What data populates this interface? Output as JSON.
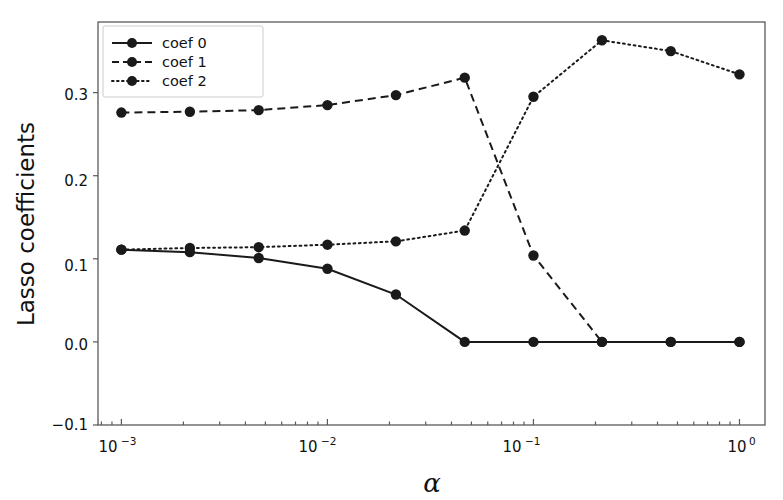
{
  "chart_data": {
    "type": "line",
    "title": "",
    "xlabel": "α",
    "ylabel": "Lasso coefficients",
    "xscale": "log",
    "yscale": "linear",
    "xlim": [
      0.00077,
      1.33
    ],
    "ylim": [
      -0.1,
      0.385
    ],
    "grid": false,
    "legend_position": "upper left",
    "x": [
      0.001,
      0.00215,
      0.00464,
      0.01,
      0.0215,
      0.0464,
      0.1,
      0.215,
      0.464,
      1.0
    ],
    "xtick_labels": [
      "10−3",
      "10−2",
      "10−1",
      "10⁰"
    ],
    "xtick_values": [
      0.001,
      0.01,
      0.1,
      1.0
    ],
    "ytick_labels": [
      "−0.1",
      "0.0",
      "0.1",
      "0.2",
      "0.3"
    ],
    "ytick_values": [
      -0.1,
      0.0,
      0.1,
      0.2,
      0.3
    ],
    "series": [
      {
        "name": "coef 0",
        "linestyle": "solid",
        "color": "#1a1a1a",
        "marker": "o",
        "values": [
          0.111,
          0.108,
          0.101,
          0.088,
          0.057,
          0.0,
          0.0,
          0.0,
          0.0,
          0.0
        ]
      },
      {
        "name": "coef 1",
        "linestyle": "dashed",
        "color": "#1a1a1a",
        "marker": "o",
        "values": [
          0.276,
          0.277,
          0.279,
          0.285,
          0.297,
          0.318,
          0.104,
          0.0,
          0.0,
          0.0
        ]
      },
      {
        "name": "coef 2",
        "linestyle": "dotted",
        "color": "#1a1a1a",
        "marker": "o",
        "values": [
          0.111,
          0.113,
          0.114,
          0.117,
          0.121,
          0.134,
          0.295,
          0.363,
          0.35,
          0.322
        ]
      }
    ]
  },
  "legend": {
    "entries": [
      {
        "label": "coef 0"
      },
      {
        "label": "coef 1"
      },
      {
        "label": "coef 2"
      }
    ]
  },
  "axis": {
    "y_title": "Lasso coefficients",
    "x_title": "α",
    "ytick_0": "0.3",
    "ytick_1": "0.2",
    "ytick_2": "0.1",
    "ytick_3": "0.0",
    "ytick_4": "−0.1",
    "xtick_0_base": "10",
    "xtick_0_exp": "−3",
    "xtick_1_base": "10",
    "xtick_1_exp": "−2",
    "xtick_2_base": "10",
    "xtick_2_exp": "−1",
    "xtick_3_base": "10",
    "xtick_3_exp": "0"
  }
}
